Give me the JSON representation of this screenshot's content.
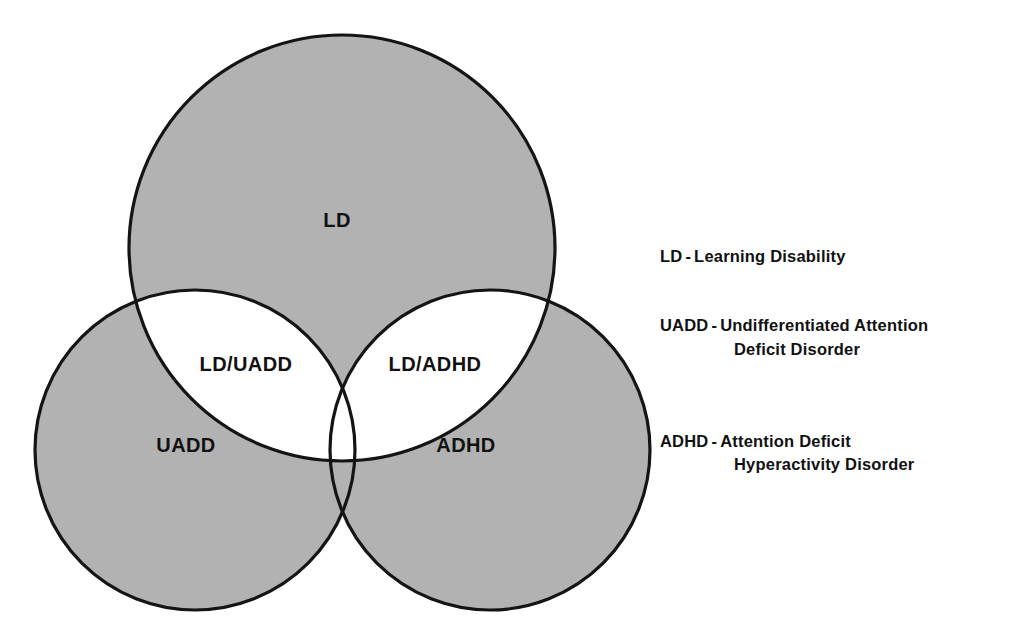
{
  "figure": {
    "type": "venn-diagram",
    "title": "",
    "background_color": "#ffffff",
    "fill_color": "#b2b2b2",
    "stroke_color": "#141414",
    "intersection_fill": "#ffffff"
  },
  "diagram": {
    "sets": [
      {
        "id": "ld",
        "label": "LD",
        "label_x": 337,
        "label_y": 222,
        "cx": 342,
        "cy": 248,
        "r": 213
      },
      {
        "id": "uadd",
        "label": "UADD",
        "label_x": 186,
        "label_y": 447,
        "cx": 195,
        "cy": 450,
        "r": 160
      },
      {
        "id": "adhd",
        "label": "ADHD",
        "label_x": 466,
        "label_y": 447,
        "cx": 490,
        "cy": 450,
        "r": 160
      }
    ],
    "intersections": [
      {
        "id": "ld-uadd",
        "label": "LD/UADD",
        "label_x": 246,
        "label_y": 366
      },
      {
        "id": "ld-adhd",
        "label": "LD/ADHD",
        "label_x": 435,
        "label_y": 366
      }
    ]
  },
  "legend": {
    "entries": [
      {
        "id": "ld",
        "term": "LD",
        "dash": "-",
        "definition": "Learning Disability",
        "definition_line2": ""
      },
      {
        "id": "uadd",
        "term": "UADD",
        "dash": "-",
        "definition": "Undifferentiated Attention",
        "definition_line2": "Deficit Disorder"
      },
      {
        "id": "adhd",
        "term": "ADHD",
        "dash": "-",
        "definition": "Attention Deficit",
        "definition_line2": "Hyperactivity Disorder"
      }
    ]
  }
}
